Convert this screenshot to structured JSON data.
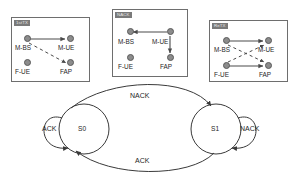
{
  "figure": {
    "line_color": "#4a4a4a",
    "node_fill": "#8c8c8c",
    "node_stroke": "#5a5a5a",
    "badge_bg": "#7a7a7a",
    "badge_text_color": "#e8e8e8",
    "panel_border": "#6e6e6e"
  },
  "panels": [
    {
      "id": "panel-1st-tx",
      "badge": "1stTX",
      "nodes": [
        {
          "name": "m-bs",
          "label": "M-BS"
        },
        {
          "name": "m-ue",
          "label": "M-UE"
        },
        {
          "name": "f-ue",
          "label": "F-UE"
        },
        {
          "name": "fap",
          "label": "FAP"
        }
      ],
      "links": [
        {
          "from": "M-BS",
          "to": "M-UE",
          "style": "solid",
          "arrow": true
        },
        {
          "from": "M-BS",
          "to": "FAP",
          "style": "dashed",
          "arrow": true
        }
      ]
    },
    {
      "id": "panel-nack",
      "badge": "NACK",
      "nodes": [
        {
          "name": "m-bs",
          "label": "M-BS"
        },
        {
          "name": "m-ue",
          "label": "M-UE"
        },
        {
          "name": "f-ue",
          "label": "F-UE"
        },
        {
          "name": "fap",
          "label": "FAP"
        }
      ],
      "links": [
        {
          "from": "M-UE",
          "to": "M-BS",
          "style": "solid",
          "arrow": true
        },
        {
          "from": "M-UE",
          "to": "FAP",
          "style": "solid",
          "arrow": true
        }
      ]
    },
    {
      "id": "panel-re-tx",
      "badge": "ReTX",
      "nodes": [
        {
          "name": "m-bs",
          "label": "M-BS"
        },
        {
          "name": "m-ue",
          "label": "M-UE"
        },
        {
          "name": "f-ue",
          "label": "F-UE"
        },
        {
          "name": "fap",
          "label": "FAP"
        }
      ],
      "links": [
        {
          "from": "M-BS",
          "to": "M-UE",
          "style": "solid",
          "arrow": true
        },
        {
          "from": "F-UE",
          "to": "FAP",
          "style": "solid",
          "arrow": true
        },
        {
          "from": "M-BS",
          "to": "FAP",
          "style": "dashed",
          "arrow": true
        },
        {
          "from": "F-UE",
          "to": "M-UE",
          "style": "dashed",
          "arrow": true
        }
      ]
    }
  ],
  "state_machine": {
    "states": [
      {
        "name": "state-s0",
        "label": "S0"
      },
      {
        "name": "state-s1",
        "label": "S1"
      }
    ],
    "transitions": [
      {
        "name": "s0-to-s1",
        "from": "S0",
        "to": "S1",
        "label": "NACK",
        "position": "top"
      },
      {
        "name": "s1-to-s0",
        "from": "S1",
        "to": "S0",
        "label": "ACK",
        "position": "bottom"
      },
      {
        "name": "s0-self",
        "from": "S0",
        "to": "S0",
        "label": "ACK",
        "position": "left-loop"
      },
      {
        "name": "s1-self",
        "from": "S1",
        "to": "S1",
        "label": "NACK",
        "position": "right-loop"
      }
    ]
  }
}
